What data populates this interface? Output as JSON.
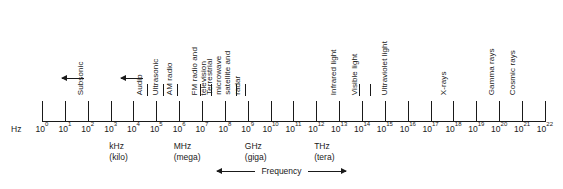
{
  "axis": {
    "unit_symbol": "Hz",
    "exponent_base": "10",
    "exponents": [
      0,
      1,
      2,
      3,
      4,
      5,
      6,
      7,
      8,
      9,
      10,
      11,
      12,
      13,
      14,
      15,
      16,
      17,
      18,
      19,
      20,
      21,
      22
    ],
    "tick_labels": [
      "10⁰",
      "10¹",
      "10²",
      "10³",
      "10⁴",
      "10⁵",
      "10⁶",
      "10⁷",
      "10⁸",
      "10⁹",
      "10¹⁰",
      "10¹¹",
      "10¹²",
      "10¹³",
      "10¹⁴",
      "10¹⁵",
      "10¹⁶",
      "10¹⁷",
      "10¹⁸",
      "10¹⁹",
      "10²⁰",
      "10²¹",
      "10²²"
    ],
    "line_color": "#1a1a1a"
  },
  "units": [
    {
      "symbol": "kHz",
      "word": "(kilo)",
      "exponent": 3
    },
    {
      "symbol": "MHz",
      "word": "(mega)",
      "exponent": 6
    },
    {
      "symbol": "GHz",
      "word": "(giga)",
      "exponent": 9
    },
    {
      "symbol": "THz",
      "word": "(tera)",
      "exponent": 12
    }
  ],
  "bands": [
    {
      "label": "Subsonic",
      "lines": [
        "Subsonic"
      ],
      "has_arrow": true,
      "arrow_dir": "left"
    },
    {
      "label": "Audio",
      "lines": [
        "Audio"
      ],
      "has_arrow": true,
      "arrow_dir": "left"
    },
    {
      "label": "Ultrasonic",
      "lines": [
        "Ultrasonic"
      ],
      "has_arrow": false
    },
    {
      "label": "AM radio",
      "lines": [
        "AM radio"
      ],
      "has_arrow": false
    },
    {
      "label": "FM radio and television",
      "lines": [
        "FM radio and",
        "television"
      ],
      "has_arrow": false
    },
    {
      "label": "Terrestrial microwave satellite and radar",
      "lines": [
        "Terrestrial",
        "microwave",
        "satellite and",
        "radar"
      ],
      "has_arrow": false
    },
    {
      "label": "Infrared light",
      "lines": [
        "Infrared light"
      ],
      "has_arrow": false
    },
    {
      "label": "Visible light",
      "lines": [
        "Visible light"
      ],
      "has_arrow": false
    },
    {
      "label": "Ultraviolet light",
      "lines": [
        "Ultraviolet light"
      ],
      "has_arrow": false
    },
    {
      "label": "X-rays",
      "lines": [
        "X-rays"
      ],
      "has_arrow": false
    },
    {
      "label": "Gamma rays",
      "lines": [
        "Gamma rays"
      ],
      "has_arrow": false
    },
    {
      "label": "Cosmic rays",
      "lines": [
        "Cosmic rays"
      ],
      "has_arrow": false
    }
  ],
  "footer": {
    "axis_caption": "Frequency"
  },
  "chart_data": {
    "type": "bar",
    "title": "",
    "xlabel": "Frequency",
    "ylabel": "",
    "x_scale": "log10",
    "x_unit": "Hz",
    "xlim": [
      0,
      22
    ],
    "grid": false,
    "legend": false,
    "categories": [
      "10⁰",
      "10¹",
      "10²",
      "10³",
      "10⁴",
      "10⁵",
      "10⁶",
      "10⁷",
      "10⁸",
      "10⁹",
      "10¹⁰",
      "10¹¹",
      "10¹²",
      "10¹³",
      "10¹⁴",
      "10¹⁵",
      "10¹⁶",
      "10¹⁷",
      "10¹⁸",
      "10¹⁹",
      "10²⁰",
      "10²¹",
      "10²²"
    ],
    "values": [
      0,
      0,
      0,
      0,
      0,
      0,
      0,
      0,
      0,
      0,
      0,
      0,
      0,
      0,
      0,
      0,
      0,
      0,
      0,
      0,
      0,
      0,
      0
    ],
    "annotations": [
      {
        "text": "Subsonic",
        "x_exponent_marker": 2.0,
        "arrow": "left"
      },
      {
        "text": "Audio",
        "x_exponent_marker": 4.6,
        "arrow": "left"
      },
      {
        "text": "Ultrasonic",
        "x_exponent_marker": 5.3,
        "arrow": "none"
      },
      {
        "text": "AM radio",
        "x_exponent_marker": 5.9,
        "arrow": "none"
      },
      {
        "text": "FM radio and television",
        "x_exponent_marker": 7.4,
        "arrow": "none"
      },
      {
        "text": "Terrestrial microwave satellite and radar",
        "x_exponent_marker": 8.9,
        "arrow": "none"
      },
      {
        "text": "Infrared light",
        "x_exponent_marker": 13.1,
        "arrow": "none"
      },
      {
        "text": "Visible light",
        "x_exponent_marker": 14.0,
        "arrow": "none"
      },
      {
        "text": "Ultraviolet light",
        "x_exponent_marker": 15.3,
        "arrow": "none"
      },
      {
        "text": "X-rays",
        "x_exponent_marker": 17.9,
        "arrow": "none"
      },
      {
        "text": "Gamma rays",
        "x_exponent_marker": 20.0,
        "arrow": "none"
      },
      {
        "text": "Cosmic rays",
        "x_exponent_marker": 20.9,
        "arrow": "none"
      }
    ],
    "unit_markers": [
      {
        "symbol": "kHz",
        "word": "(kilo)",
        "x_exponent": 3
      },
      {
        "symbol": "MHz",
        "word": "(mega)",
        "x_exponent": 6
      },
      {
        "symbol": "GHz",
        "word": "(giga)",
        "x_exponent": 9
      },
      {
        "symbol": "THz",
        "word": "(tera)",
        "x_exponent": 12
      }
    ]
  }
}
